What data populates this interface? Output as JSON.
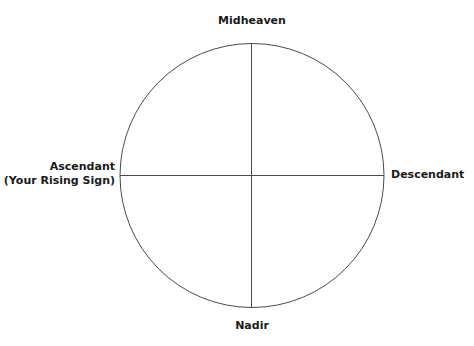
{
  "diagram": {
    "type": "astrological-chart-wheel",
    "stroke_color": "#4a4a4a",
    "text_color": "#1a1a1a",
    "labels": {
      "top": "Midheaven",
      "bottom": "Nadir",
      "left_line1": "Ascendant",
      "left_line2": "(Your Rising Sign)",
      "right": "Descendant"
    }
  }
}
